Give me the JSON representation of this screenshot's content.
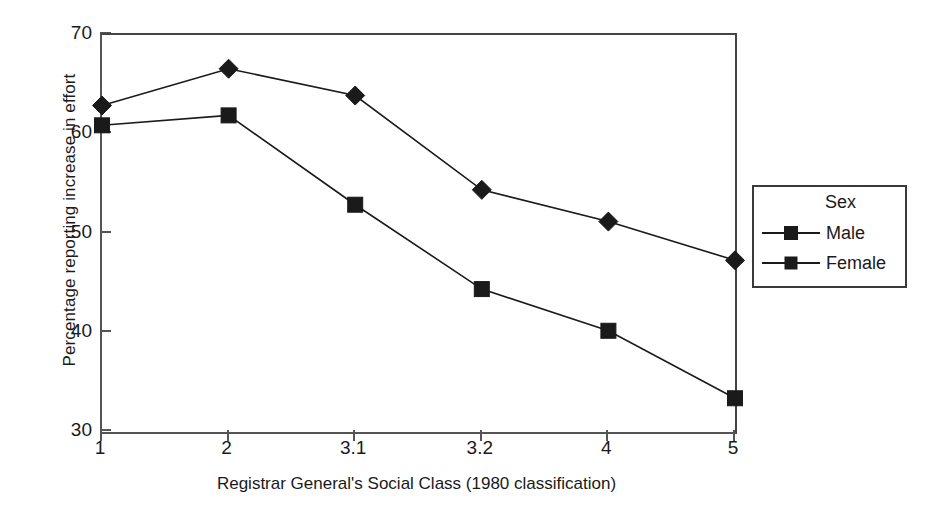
{
  "chart_data": {
    "type": "line",
    "title": "",
    "xlabel": "Registrar General's Social Class (1980 classification)",
    "ylabel": "Percentage reporting increase in effort",
    "categories": [
      "1",
      "2",
      "3.1",
      "3.2",
      "4",
      "5"
    ],
    "xticklabels": [
      "1",
      "2",
      "3.1",
      "3.2",
      "4",
      "5"
    ],
    "yticklabels": [
      "30",
      "40",
      "50",
      "60",
      "70"
    ],
    "yticks": [
      30,
      40,
      50,
      60,
      70
    ],
    "ylim": [
      30,
      70
    ],
    "grid": false,
    "legend_position": "right-outside",
    "legend_title": "Sex",
    "series": [
      {
        "name": "Male",
        "marker": "diamond",
        "color": "#1a1a1a",
        "values": [
          62.9,
          66.6,
          63.9,
          54.4,
          51.2,
          47.3
        ]
      },
      {
        "name": "Female",
        "marker": "square",
        "color": "#1a1a1a",
        "values": [
          60.9,
          61.9,
          52.9,
          44.4,
          40.2,
          33.4
        ]
      }
    ]
  },
  "legend": {
    "title": "Sex",
    "entries": [
      {
        "label": "Male",
        "marker": "diamond"
      },
      {
        "label": "Female",
        "marker": "square"
      }
    ]
  },
  "axes": {
    "y_title": "Percentage reporting increase in effort",
    "x_title": "Registrar General's Social Class (1980 classification)"
  }
}
